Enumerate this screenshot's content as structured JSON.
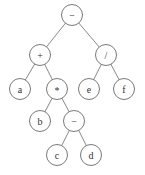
{
  "diagram": {
    "type": "expression-tree",
    "nodes": [
      {
        "id": "n1",
        "label": "−",
        "x": 72,
        "y": 15
      },
      {
        "id": "n2",
        "label": "+",
        "x": 40,
        "y": 55
      },
      {
        "id": "n3",
        "label": "/",
        "x": 106,
        "y": 55
      },
      {
        "id": "n4",
        "label": "a",
        "x": 20,
        "y": 89
      },
      {
        "id": "n5",
        "label": "*",
        "x": 57,
        "y": 89
      },
      {
        "id": "n6",
        "label": "e",
        "x": 89,
        "y": 89
      },
      {
        "id": "n7",
        "label": "f",
        "x": 124,
        "y": 89
      },
      {
        "id": "n8",
        "label": "b",
        "x": 40,
        "y": 121
      },
      {
        "id": "n9",
        "label": "−",
        "x": 74,
        "y": 121
      },
      {
        "id": "n10",
        "label": "c",
        "x": 57,
        "y": 155
      },
      {
        "id": "n11",
        "label": "d",
        "x": 91,
        "y": 155
      }
    ],
    "edges": [
      [
        "n1",
        "n2"
      ],
      [
        "n1",
        "n3"
      ],
      [
        "n2",
        "n4"
      ],
      [
        "n2",
        "n5"
      ],
      [
        "n3",
        "n6"
      ],
      [
        "n3",
        "n7"
      ],
      [
        "n5",
        "n8"
      ],
      [
        "n5",
        "n9"
      ],
      [
        "n9",
        "n10"
      ],
      [
        "n9",
        "n11"
      ]
    ],
    "node_radius": 10.5
  }
}
